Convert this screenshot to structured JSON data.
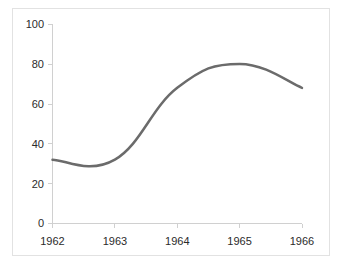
{
  "chart_data": {
    "type": "line",
    "title": "",
    "subtitle": "",
    "xlabel": "",
    "ylabel": "",
    "x": [
      1962,
      1963,
      1964,
      1965,
      1966
    ],
    "categories": [
      "1962",
      "1963",
      "1964",
      "1965",
      "1966"
    ],
    "series": [
      {
        "name": "",
        "values": [
          32,
          32,
          68,
          80,
          68
        ],
        "color": "#6b6b6b",
        "line_width": 2.5,
        "smoothing": "spline"
      }
    ],
    "xlim": [
      1962,
      1966
    ],
    "ylim": [
      0,
      100
    ],
    "y_ticks": [
      0,
      20,
      40,
      60,
      80,
      100
    ],
    "y_tick_labels": [
      "0",
      "20",
      "40",
      "60",
      "80",
      "100"
    ],
    "x_ticks": [
      1962,
      1963,
      1964,
      1965,
      1966
    ],
    "x_tick_labels": [
      "1962",
      "1963",
      "1964",
      "1965",
      "1966"
    ],
    "grid": false,
    "legend": false,
    "legend_position": "none",
    "annotations": [],
    "notes": {
      "local_minimum_value": 31,
      "local_minimum_x": 1962.5,
      "peak_value": 80.5,
      "peak_x": 1964.85,
      "start_value": 32,
      "end_value": 68
    }
  },
  "axes": {
    "axis_color": "#d0d0d0",
    "frame_color": "#e2e2e2",
    "label_color": "#2b2b2b",
    "background": "#ffffff"
  }
}
